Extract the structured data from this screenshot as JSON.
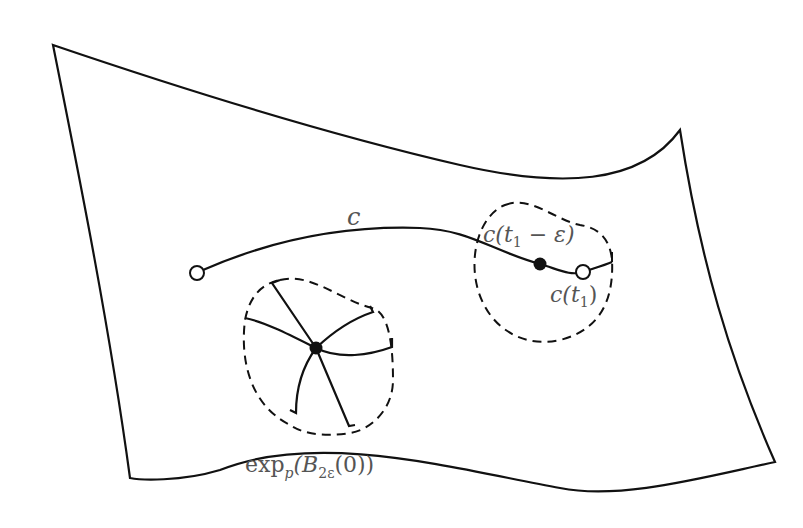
{
  "diagram": {
    "colors": {
      "stroke": "#111111",
      "label": "#555555",
      "background": "#ffffff"
    },
    "labels": {
      "curve": "c",
      "point_near_end": {
        "base": "c(t",
        "sub": "1",
        "rest": " − ε)"
      },
      "end_point": {
        "base": "c(t",
        "sub": "1",
        "rest": ")"
      },
      "normal_ball": {
        "base": "exp",
        "sub": "p",
        "mid": "(B",
        "sub2": "2ε",
        "rest": "(0))"
      }
    },
    "points": [
      {
        "name": "curve-start",
        "type": "open",
        "x": 197,
        "y": 273
      },
      {
        "name": "c-t1-minus-eps",
        "type": "filled",
        "x": 540,
        "y": 264
      },
      {
        "name": "c-t1",
        "type": "open",
        "x": 583,
        "y": 272
      },
      {
        "name": "p",
        "type": "filled",
        "x": 316,
        "y": 348
      }
    ]
  }
}
